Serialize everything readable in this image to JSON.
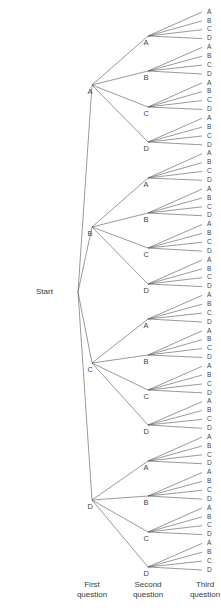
{
  "diagram": {
    "type": "tree",
    "title": "",
    "background_color": "#ffffff",
    "line_color": "#555555",
    "text_color": "#3a3a3a",
    "start": {
      "label": "Start",
      "x": 72,
      "y": 292
    },
    "levels": [
      {
        "name": "first-question",
        "caption_line1": "First",
        "caption_line2": "question",
        "caption_x": 92,
        "node_x": 92,
        "nodes": [
          {
            "label": "A",
            "y": 85
          },
          {
            "label": "B",
            "y": 227
          },
          {
            "label": "C",
            "y": 363
          },
          {
            "label": "D",
            "y": 500
          }
        ]
      },
      {
        "name": "second-question",
        "caption_line1": "Second",
        "caption_line2": "question",
        "caption_x": 148,
        "node_x": 148,
        "nodes": [
          {
            "label": "A",
            "y": 36
          },
          {
            "label": "B",
            "y": 71
          },
          {
            "label": "C",
            "y": 107
          },
          {
            "label": "D",
            "y": 142
          },
          {
            "label": "A",
            "y": 178
          },
          {
            "label": "B",
            "y": 213
          },
          {
            "label": "C",
            "y": 248
          },
          {
            "label": "D",
            "y": 284
          },
          {
            "label": "A",
            "y": 319
          },
          {
            "label": "B",
            "y": 355
          },
          {
            "label": "C",
            "y": 390
          },
          {
            "label": "D",
            "y": 425
          },
          {
            "label": "A",
            "y": 461
          },
          {
            "label": "B",
            "y": 496
          },
          {
            "label": "C",
            "y": 532
          },
          {
            "label": "D",
            "y": 567
          }
        ]
      },
      {
        "name": "third-question",
        "caption_line1": "Third",
        "caption_line2": "question",
        "caption_x": 205,
        "node_x": 202,
        "label_x": 205,
        "first_y": 12,
        "spacing": 8.857,
        "count": 64,
        "labels": [
          "A",
          "B",
          "C",
          "D",
          "A",
          "B",
          "C",
          "D",
          "A",
          "B",
          "C",
          "D",
          "A",
          "B",
          "C",
          "D",
          "A",
          "B",
          "C",
          "D",
          "A",
          "B",
          "C",
          "D",
          "A",
          "B",
          "C",
          "D",
          "A",
          "B",
          "C",
          "D",
          "A",
          "B",
          "C",
          "D",
          "A",
          "B",
          "C",
          "D",
          "A",
          "B",
          "C",
          "D",
          "A",
          "B",
          "C",
          "D",
          "A",
          "B",
          "C",
          "D",
          "A",
          "B",
          "C",
          "D",
          "A",
          "B",
          "C",
          "D",
          "A",
          "B",
          "C",
          "D"
        ]
      }
    ],
    "captions_y": 580
  }
}
